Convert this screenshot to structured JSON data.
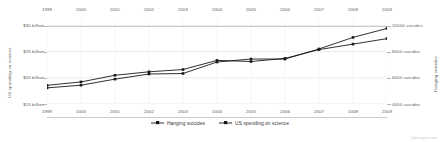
{
  "chart_data": {
    "type": "line",
    "title": "",
    "x": [
      1999,
      2000,
      2001,
      2002,
      2003,
      2004,
      2005,
      2006,
      2007,
      2008,
      2009
    ],
    "xlabel": "",
    "xtick_labels": [
      "1999",
      "2000",
      "2001",
      "2002",
      "2003",
      "2004",
      "2005",
      "2006",
      "2007",
      "2008",
      "2009"
    ],
    "xlim": [
      1999,
      2009
    ],
    "grid": true,
    "legend_position": "bottom-center",
    "axes": [
      {
        "id": "left",
        "title": "US spending on science",
        "side": "left",
        "ylim": [
          15,
          31.25
        ],
        "ticks": [
          15,
          20,
          25,
          30
        ],
        "tick_labels": [
          "$15 billion",
          "$20 billion",
          "$25 billion",
          "$30 billion"
        ]
      },
      {
        "id": "right",
        "title": "Hanging suicides",
        "side": "right",
        "ylim": [
          4000,
          10500
        ],
        "ticks": [
          4000,
          6000,
          8000,
          10000
        ],
        "tick_labels": [
          "4000 suicides",
          "6000 suicides",
          "8000 suicides",
          "10000 suicides"
        ]
      }
    ],
    "series": [
      {
        "name": "Hanging suicides",
        "axis": "right",
        "color": "#1a1a1a",
        "marker": "square",
        "values": [
          5427,
          5688,
          6198,
          6462,
          6635,
          7336,
          7248,
          7491,
          8161,
          8578,
          9000
        ]
      },
      {
        "name": "US spending on science",
        "axis": "left",
        "color": "#1a1a1a",
        "marker": "square",
        "values": [
          18.079,
          18.594,
          19.753,
          20.734,
          20.831,
          23.029,
          23.597,
          23.584,
          25.525,
          27.731,
          29.449
        ]
      }
    ]
  },
  "legend": {
    "entries": [
      {
        "label": "Hanging suicides",
        "marker": "line-with-square-marker"
      },
      {
        "label": "US spending on science",
        "marker": "line-with-square-marker"
      }
    ]
  },
  "watermark": {
    "text": "tylervigen.com"
  }
}
